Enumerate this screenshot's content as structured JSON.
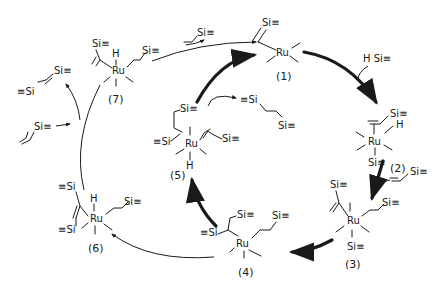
{
  "diagram": {
    "type": "catalytic-cycle",
    "metal": "Ru",
    "silyl_group": "Si≡",
    "silyl_group_left": "≡Si",
    "hydride": "H",
    "hydrosilane": "H Si≡",
    "complexes": [
      {
        "id": "1",
        "label": "(1)"
      },
      {
        "id": "2",
        "label": "(2)"
      },
      {
        "id": "3",
        "label": "(3)"
      },
      {
        "id": "4",
        "label": "(4)"
      },
      {
        "id": "5",
        "label": "(5)"
      },
      {
        "id": "6",
        "label": "(6)"
      },
      {
        "id": "7",
        "label": "(7)"
      }
    ],
    "reagents": {
      "vinylsilane": "vinylsilane",
      "hydrosilane": "hydrosilane",
      "bis_silylethane": "1,2-bis(silyl)ethane",
      "bis_silylethene": "1,2-bis(silyl)ethene"
    }
  }
}
